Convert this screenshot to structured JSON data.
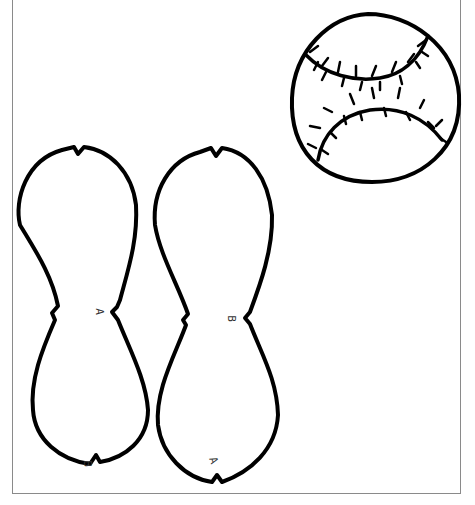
{
  "page": {
    "stroke_color": "#000000",
    "background": "#ffffff",
    "border_color": "#8a8a8a"
  },
  "baseball": {
    "label": "baseball-drawing"
  },
  "pattern_pieces": [
    {
      "id": "left-piece",
      "labels": {
        "waist": "A",
        "bottom": "B"
      }
    },
    {
      "id": "right-piece",
      "labels": {
        "waist": "B",
        "bottom": "A"
      }
    }
  ]
}
